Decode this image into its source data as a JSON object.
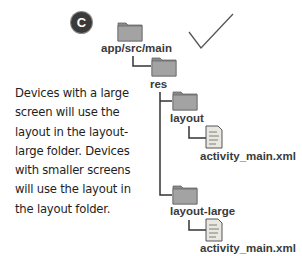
{
  "badge": {
    "letter": "C"
  },
  "tree": {
    "root": {
      "label": "app/src/main",
      "icon": "folder-icon"
    },
    "res": {
      "label": "res",
      "icon": "folder-icon"
    },
    "layout": {
      "label": "layout",
      "icon": "folder-icon"
    },
    "layout_file": {
      "label": "activity_main.xml",
      "icon": "xml-file-icon"
    },
    "layout_large": {
      "label": "layout-large",
      "icon": "folder-icon"
    },
    "layout_large_file": {
      "label": "activity_main.xml",
      "icon": "xml-file-icon"
    }
  },
  "note": {
    "lines": [
      "Devices with a large",
      "screen will use the",
      "layout in the layout-",
      "large folder. Devices",
      "with smaller screens",
      "will use the layout in",
      "the layout folder."
    ]
  },
  "mark": {
    "icon": "checkmark-icon"
  },
  "colors": {
    "folder": "#9a9a9a",
    "folder_dark": "#7c7c7c",
    "line": "#333333",
    "badge": "#3a3a3a"
  }
}
